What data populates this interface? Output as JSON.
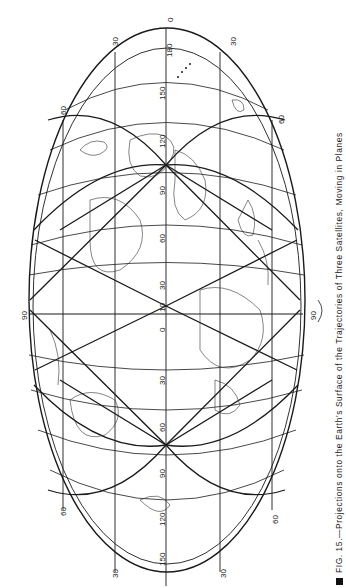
{
  "figure": {
    "orientation": "rotated 90 degrees counter-clockwise",
    "projection": "elliptical world map",
    "caption_number": "FIG. 15.",
    "caption_text": "—Projections onto the Earth's Surface of the Trajectories of Three Satellites, Moving in Planes",
    "labels": {
      "top_center_outer": "0",
      "top_center_inner": "180",
      "top_left": "30",
      "top_right": "30",
      "upper_left_60": "60",
      "upper_right_60": "60",
      "lower_left_60": "60",
      "lower_right_60": "60",
      "left_equator": "90",
      "right_equator": "90",
      "bottom_left": "30",
      "bottom_right": "30",
      "center_meridian": [
        "150",
        "120",
        "90",
        "60",
        "30",
        "10",
        "0",
        "30",
        "60",
        "90",
        "120",
        "150"
      ]
    },
    "colors": {
      "ink": "#1a1a1a",
      "paper": "#ffffff"
    }
  }
}
